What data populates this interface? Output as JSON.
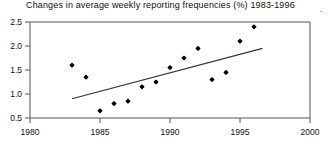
{
  "chart_data": {
    "type": "scatter",
    "title": "Changes in average weekly reporting frequencies (%) 1983-1996",
    "xlabel": "",
    "ylabel": "",
    "xlim": [
      1980,
      2000
    ],
    "ylim": [
      0.5,
      2.5
    ],
    "xticks": [
      1980,
      1985,
      1990,
      1995,
      2000
    ],
    "xtick_labels": [
      "1980",
      "1985",
      "1990",
      "1995",
      "2000"
    ],
    "yticks": [
      0.5,
      1.0,
      1.5,
      2.0,
      2.5
    ],
    "ytick_labels": [
      "0.5",
      "1.0",
      "1.5",
      "2.0",
      "2.5"
    ],
    "grid": false,
    "legend": false,
    "marker": "filled-diamond",
    "marker_color": "#000000",
    "x": [
      1983,
      1984,
      1985,
      1986,
      1987,
      1988,
      1989,
      1990,
      1991,
      1992,
      1993,
      1994,
      1995,
      1996
    ],
    "values": [
      1.6,
      1.35,
      0.65,
      0.8,
      0.85,
      1.15,
      1.25,
      1.55,
      1.75,
      1.95,
      1.3,
      1.45,
      2.1,
      2.4
    ],
    "points": [
      {
        "x": 1983,
        "y": 1.6
      },
      {
        "x": 1984,
        "y": 1.35
      },
      {
        "x": 1985,
        "y": 0.65
      },
      {
        "x": 1986,
        "y": 0.8
      },
      {
        "x": 1987,
        "y": 0.85
      },
      {
        "x": 1988,
        "y": 1.15
      },
      {
        "x": 1989,
        "y": 1.25
      },
      {
        "x": 1990,
        "y": 1.55
      },
      {
        "x": 1991,
        "y": 1.75
      },
      {
        "x": 1992,
        "y": 1.95
      },
      {
        "x": 1993,
        "y": 1.3
      },
      {
        "x": 1994,
        "y": 1.45
      },
      {
        "x": 1995,
        "y": 2.1
      },
      {
        "x": 1996,
        "y": 2.4
      }
    ],
    "trendline": {
      "type": "line",
      "color": "#333333",
      "x_start": 1983.0,
      "y_start": 0.9,
      "x_end": 1996.6,
      "y_end": 1.95
    },
    "annotations": [
      {
        "text": ".",
        "x": 320,
        "y": 8
      }
    ]
  },
  "axes": {
    "frame_color": "#555555",
    "tick_color": "#555555"
  }
}
